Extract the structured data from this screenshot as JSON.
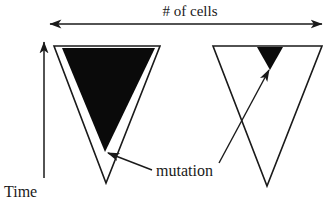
{
  "figure": {
    "type": "diagram",
    "background_color": "#ffffff",
    "line_color": "#1a1a1a",
    "fill_color": "#0a0a0a",
    "width": 329,
    "height": 203
  },
  "axes": {
    "horizontal": {
      "label": "# of cells",
      "label_x": 190,
      "label_y": 16,
      "arrow_y": 24,
      "arrow_x_start": 50,
      "arrow_x_end": 322,
      "double_headed": true,
      "direction": "horizontal"
    },
    "vertical": {
      "label": "Time",
      "label_x": 4,
      "label_y": 196,
      "arrow_x": 44,
      "arrow_y_start": 178,
      "arrow_y_end": 42,
      "double_headed": false,
      "direction": "up"
    }
  },
  "shapes": [
    {
      "name": "left-cell-population",
      "outline": {
        "points": "54,46 160,46 106,183",
        "description": "large inverted outlined triangle"
      },
      "mutant_clone": {
        "points": "62,48 155,48 105,152",
        "description": "large filled black inverted triangle (early mutation, large clone)"
      }
    },
    {
      "name": "right-cell-population",
      "outline": {
        "points": "213,46 322,46 267,186",
        "description": "large inverted outlined triangle"
      },
      "mutant_clone": {
        "points": "257,47 283,47 270,70",
        "description": "small filled black inverted triangle (late mutation, small clone)"
      }
    }
  ],
  "annotations": [
    {
      "name": "mutation-label",
      "text": "mutation",
      "x": 155,
      "y": 174
    },
    {
      "name": "mutation-pointer-left",
      "from_x": 152,
      "from_y": 170,
      "to_x": 108,
      "to_y": 153,
      "arrowhead": true
    },
    {
      "name": "mutation-pointer-right",
      "from_x": 219,
      "from_y": 163,
      "to_x": 269,
      "to_y": 70,
      "arrowhead": true
    }
  ]
}
